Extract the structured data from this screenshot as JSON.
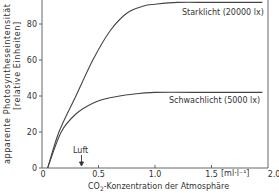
{
  "chart_data": {
    "type": "line",
    "title": "",
    "xlabel": "CO2-Konzentration der Atmosphäre",
    "xlabel_sub_prefix": "CO",
    "xlabel_sub": "2",
    "xlabel_suffix": "-Konzentration der Atmosphäre",
    "x_unit": "[ml·l⁻¹]",
    "ylabel": "apparente Photosyntheseintensität",
    "ylabel_line2": "[relative Einheiten]",
    "xlim": [
      0,
      2.0
    ],
    "ylim": [
      0,
      95
    ],
    "x_ticks": [
      "0",
      "0.5",
      "1.0",
      "1.5",
      "2.0"
    ],
    "y_ticks": [
      "0",
      "20",
      "40",
      "60",
      "80"
    ],
    "grid": false,
    "annotation": {
      "text": "Luft",
      "x": 0.35,
      "arrow": "down"
    },
    "series": [
      {
        "name": "Starklicht (20000 lx)",
        "x": [
          0.05,
          0.15,
          0.3,
          0.45,
          0.6,
          0.75,
          0.9,
          1.0,
          1.2,
          1.5,
          1.95
        ],
        "values": [
          0,
          20,
          40,
          60,
          76,
          86,
          90,
          91,
          92,
          92,
          92
        ]
      },
      {
        "name": "Schwachlicht (5000 lx)",
        "x": [
          0.05,
          0.17,
          0.3,
          0.45,
          0.6,
          0.8,
          1.0,
          1.5,
          1.95
        ],
        "values": [
          0,
          20,
          30,
          36,
          39,
          41,
          42,
          42,
          42
        ]
      }
    ]
  }
}
